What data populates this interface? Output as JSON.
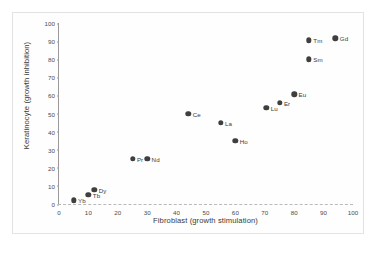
{
  "chart_data": {
    "type": "scatter",
    "title": "",
    "xlabel": "Fibroblast (growth stimulation)",
    "ylabel": "Keratinocyte (growth inhibition)",
    "xlim": [
      0,
      100
    ],
    "ylim": [
      0,
      100
    ],
    "xticks": [
      0,
      10,
      20,
      30,
      40,
      50,
      60,
      70,
      80,
      90,
      100
    ],
    "yticks": [
      0,
      10,
      20,
      30,
      40,
      50,
      60,
      70,
      80,
      90,
      100
    ],
    "grid": false,
    "legend": "none",
    "marker_color": "#3f3f3f",
    "points": [
      {
        "label": "Yb",
        "x": 5,
        "y": 2,
        "label_side": "right"
      },
      {
        "label": "Tb",
        "x": 10,
        "y": 5,
        "label_side": "right"
      },
      {
        "label": "Dy",
        "x": 12,
        "y": 8,
        "label_side": "right"
      },
      {
        "label": "Pr",
        "x": 25,
        "y": 25,
        "label_side": "right"
      },
      {
        "label": "Nd",
        "x": 30,
        "y": 25,
        "label_side": "right"
      },
      {
        "label": "Ce",
        "x": 44,
        "y": 50,
        "label_side": "right"
      },
      {
        "label": "La",
        "x": 55,
        "y": 45,
        "label_side": "right"
      },
      {
        "label": "Ho",
        "x": 60,
        "y": 35,
        "label_side": "right"
      },
      {
        "label": "Lu",
        "x": 70.5,
        "y": 53,
        "label_side": "right"
      },
      {
        "label": "Er",
        "x": 75,
        "y": 56,
        "label_side": "right"
      },
      {
        "label": "Eu",
        "x": 80,
        "y": 60.5,
        "label_side": "right"
      },
      {
        "label": "Sm",
        "x": 85,
        "y": 80,
        "label_side": "right"
      },
      {
        "label": "Tm",
        "x": 85,
        "y": 90.5,
        "label_side": "right"
      },
      {
        "label": "Gd",
        "x": 94,
        "y": 91.5,
        "label_side": "right"
      }
    ]
  }
}
